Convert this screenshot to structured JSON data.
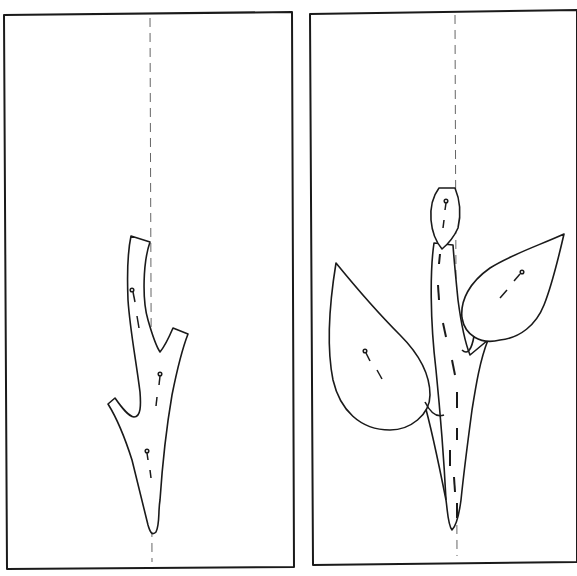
{
  "figure": {
    "type": "two-panel line illustration",
    "background": "#ffffff",
    "stroke_color": "#1a1a1a",
    "guide_color": "#555555",
    "panels": [
      {
        "id": "step-1",
        "description": "Forked stem piece pinned along dashed center guide line",
        "elements": [
          "frame",
          "center-guide-line",
          "stem-piece",
          "pins"
        ],
        "pin_count": 3
      },
      {
        "id": "step-2",
        "description": "Stem with bud on top and two leaves (left and right) pinned along dashed center guide line",
        "elements": [
          "frame",
          "center-guide-line",
          "stem-piece",
          "bud",
          "left-leaf",
          "right-leaf",
          "pins"
        ],
        "pin_count": 3
      }
    ]
  }
}
